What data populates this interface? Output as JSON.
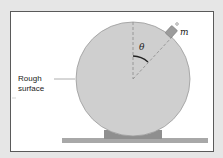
{
  "diagram": {
    "labels": {
      "surface_line1": "Rough",
      "surface_line2": "surface",
      "angle": "θ",
      "mass": "m"
    },
    "colors": {
      "background": "#e6e6e6",
      "frame_fill": "#ffffff",
      "frame_border": "#5a5a5a",
      "sphere_fill": "#cfcfcf",
      "sphere_stroke": "#9a9a9a",
      "support_fill": "#8f8f8f",
      "ground_fill": "#a8a8a8",
      "mass_fill": "#9c9c9c",
      "angle_arc": "#222222",
      "dashed_lines": "#8a8a8a"
    }
  }
}
